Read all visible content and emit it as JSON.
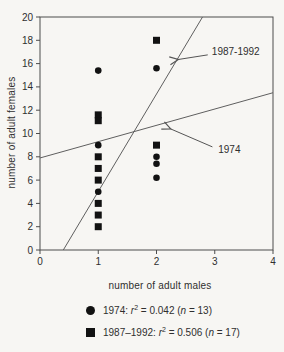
{
  "chart_data": {
    "type": "scatter",
    "title": "",
    "xlabel": "number of adult males",
    "ylabel": "number of adult females",
    "xlim": [
      0,
      4
    ],
    "ylim": [
      0,
      20
    ],
    "x_ticks": [
      0,
      1,
      2,
      3,
      4
    ],
    "y_ticks": [
      0,
      2,
      4,
      6,
      8,
      10,
      12,
      14,
      16,
      18,
      20
    ],
    "grid": false,
    "legend_position": "bottom",
    "series": [
      {
        "name": "1974",
        "marker": "circle",
        "r2": 0.042,
        "n": 13,
        "points": [
          [
            1,
            15.4
          ],
          [
            1,
            9
          ],
          [
            1,
            5
          ],
          [
            2,
            15.6
          ],
          [
            2,
            8
          ],
          [
            2,
            7.4
          ],
          [
            2,
            6.2
          ]
        ]
      },
      {
        "name": "1987-1992",
        "marker": "square",
        "r2": 0.506,
        "n": 17,
        "points": [
          [
            1,
            11.6
          ],
          [
            1,
            11.1
          ],
          [
            1,
            8
          ],
          [
            1,
            7
          ],
          [
            1,
            6
          ],
          [
            1,
            4
          ],
          [
            1,
            3
          ],
          [
            1,
            2
          ],
          [
            2,
            18
          ],
          [
            2,
            9
          ]
        ]
      }
    ],
    "trend_lines": [
      {
        "name": "1974",
        "x1": 0,
        "y1": 7.9,
        "x2": 4,
        "y2": 13.5
      },
      {
        "name": "1987-1992",
        "x1": 0.4,
        "y1": 0,
        "x2": 2.79,
        "y2": 20
      }
    ],
    "annotations": [
      {
        "label": "1987-1992",
        "text_x": 2.95,
        "text_y": 17.0,
        "arrow_from_x": 2.88,
        "arrow_from_y": 16.75,
        "arrow_to_x": 2.37,
        "arrow_to_y": 16.35
      },
      {
        "label": "1974",
        "text_x": 3.06,
        "text_y": 8.65,
        "arrow_from_x": 2.96,
        "arrow_from_y": 8.85,
        "arrow_to_x": 2.24,
        "arrow_to_y": 10.4
      }
    ],
    "legend": [
      {
        "marker": "circle",
        "prefix": "1974: ",
        "r_sym": "r",
        "r_exp": "2",
        "mid": " = 0.042 (",
        "n_sym": "n",
        "suffix": " = 13)"
      },
      {
        "marker": "square",
        "prefix": "1987–1992: ",
        "r_sym": "r",
        "r_exp": "2",
        "mid": " = 0.506 (",
        "n_sym": "n",
        "suffix": " = 17)"
      }
    ]
  },
  "colors": {
    "marker": "#121212",
    "trend_line": "#5f5f5f",
    "axis": "#4d4d4d",
    "text": "#2f2f2f",
    "background": "#f7f6f3"
  }
}
